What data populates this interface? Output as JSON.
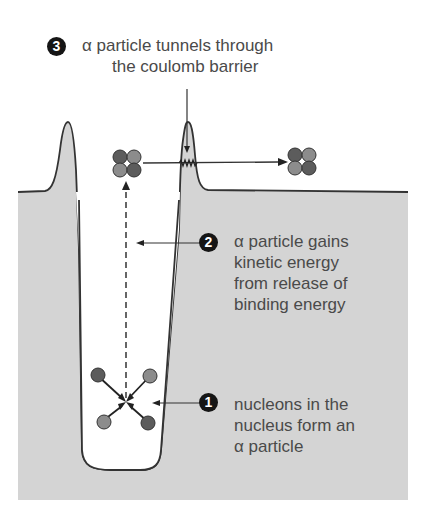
{
  "steps": [
    {
      "number": "1",
      "text_lines": [
        "nucleons in the",
        "nucleus form an",
        "α particle"
      ]
    },
    {
      "number": "2",
      "text_lines": [
        "α particle gains",
        "kinetic energy",
        "from release of",
        "binding energy"
      ]
    },
    {
      "number": "3",
      "text_lines": [
        "α particle tunnels through",
        "the coulomb barrier"
      ]
    }
  ],
  "colors": {
    "potential_fill": "#d4d4d4",
    "outline": "#333333",
    "proton": "#5c5c5c",
    "neutron": "#8c8c8c",
    "text": "#4a4a4a",
    "badge": "#151515"
  }
}
